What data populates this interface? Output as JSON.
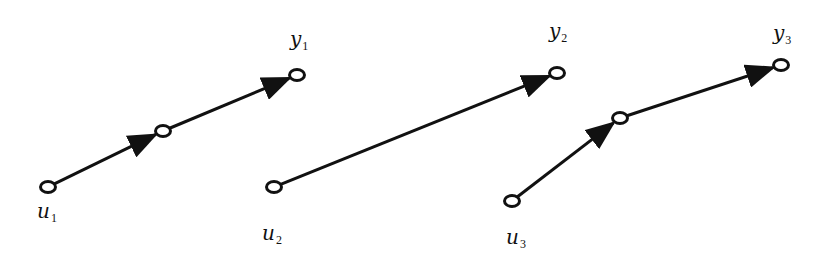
{
  "diagram": {
    "colors": {
      "stroke": "#111111",
      "background": "#ffffff"
    },
    "nodes": [
      {
        "id": "u1",
        "x": 48,
        "y": 187,
        "label": "u",
        "sub": "1",
        "lx": 37,
        "ly": 218
      },
      {
        "id": "m1",
        "x": 163,
        "y": 131
      },
      {
        "id": "y1",
        "x": 297,
        "y": 75,
        "label": "y",
        "sub": "1",
        "lx": 290,
        "ly": 46
      },
      {
        "id": "u2",
        "x": 274,
        "y": 187,
        "label": "u",
        "sub": "2",
        "lx": 262,
        "ly": 240
      },
      {
        "id": "y2",
        "x": 557,
        "y": 73,
        "label": "y",
        "sub": "2",
        "lx": 549,
        "ly": 38
      },
      {
        "id": "u3",
        "x": 512,
        "y": 201,
        "label": "u",
        "sub": "3",
        "lx": 506,
        "ly": 244
      },
      {
        "id": "m3",
        "x": 620,
        "y": 118
      },
      {
        "id": "y3",
        "x": 781,
        "y": 65,
        "label": "y",
        "sub": "3",
        "lx": 773,
        "ly": 40
      }
    ],
    "edges": [
      {
        "from": "u1",
        "to": "m1"
      },
      {
        "from": "m1",
        "to": "y1"
      },
      {
        "from": "u2",
        "to": "y2"
      },
      {
        "from": "u3",
        "to": "m3"
      },
      {
        "from": "m3",
        "to": "y3"
      }
    ],
    "groups": [
      {
        "name": "path-1",
        "nodes": [
          "u1",
          "m1",
          "y1"
        ]
      },
      {
        "name": "path-2",
        "nodes": [
          "u2",
          "y2"
        ]
      },
      {
        "name": "path-3",
        "nodes": [
          "u3",
          "m3",
          "y3"
        ]
      }
    ]
  }
}
